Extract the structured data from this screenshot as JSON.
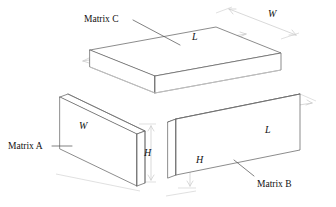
{
  "figure": {
    "kind": "isometric-matrix-multiply-diagram",
    "background_color": "#ffffff",
    "line_color": "#5a5a5a",
    "dimension_line_color": "#c9c9c9",
    "text_color": "#111111"
  },
  "labels": {
    "matrix_c": "Matrix C",
    "matrix_a": "Matrix A",
    "matrix_b": "Matrix B",
    "dim_w_top": "W",
    "dim_l_top": "L",
    "dim_w_a": "W",
    "dim_h_a": "H",
    "dim_h_b": "H",
    "dim_l_b": "L"
  },
  "blocks": [
    {
      "name": "matrix-c",
      "label": "Matrix C",
      "role": "result",
      "dimensions_shown": [
        "L",
        "W"
      ],
      "position": "top"
    },
    {
      "name": "matrix-a",
      "label": "Matrix A",
      "role": "left-operand",
      "dimensions_shown": [
        "W",
        "H"
      ],
      "position": "lower-left"
    },
    {
      "name": "matrix-b",
      "label": "Matrix B",
      "role": "right-operand",
      "dimensions_shown": [
        "L",
        "H"
      ],
      "position": "lower-right"
    }
  ]
}
